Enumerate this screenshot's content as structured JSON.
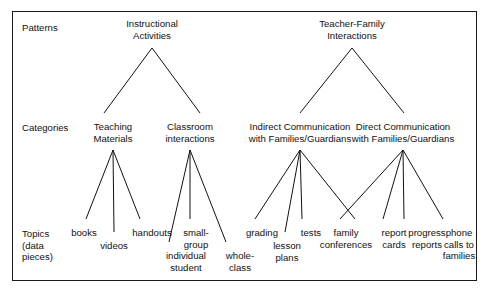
{
  "diagram": {
    "frame_color": "#1a1a1a",
    "text_color": "#111111",
    "background": "#ffffff",
    "row_labels": [
      {
        "id": "patterns",
        "label": "Patterns",
        "x": 22,
        "y": 22
      },
      {
        "id": "categories",
        "label": "Categories",
        "x": 22,
        "y": 122
      },
      {
        "id": "topics",
        "label": "Topics\n(data\npieces)",
        "x": 22,
        "y": 228
      }
    ],
    "patterns": [
      {
        "id": "instructional-activities",
        "label": "Instructional\nActivities",
        "x": 152,
        "y": 18
      },
      {
        "id": "teacher-family-interactions",
        "label": "Teacher-Family\nInteractions",
        "x": 352,
        "y": 18
      }
    ],
    "categories": [
      {
        "id": "teaching-materials",
        "label": "Teaching\nMaterials",
        "x": 113,
        "y": 121,
        "parent": "instructional-activities"
      },
      {
        "id": "classroom-interactions",
        "label": "Classroom\ninteractions",
        "x": 190,
        "y": 121,
        "parent": "instructional-activities"
      },
      {
        "id": "indirect-communication",
        "label": "Indirect Communication\nwith Families/Guardians",
        "x": 300,
        "y": 121,
        "parent": "teacher-family-interactions"
      },
      {
        "id": "direct-communication",
        "label": "Direct Communication\nwith Families/Guardians",
        "x": 403,
        "y": 121,
        "parent": "teacher-family-interactions"
      }
    ],
    "topics": [
      {
        "id": "books",
        "label": "books",
        "x": 84,
        "y": 227,
        "parent": "teaching-materials"
      },
      {
        "id": "videos",
        "label": "videos",
        "x": 114,
        "y": 240,
        "parent": "teaching-materials"
      },
      {
        "id": "handouts",
        "label": "handouts",
        "x": 152,
        "y": 227,
        "parent": "teaching-materials"
      },
      {
        "id": "individual-student",
        "label": "individual\nstudent",
        "x": 186,
        "y": 250,
        "parent": "classroom-interactions"
      },
      {
        "id": "small-group",
        "label": "small-\ngroup",
        "x": 196,
        "y": 227,
        "parent": "classroom-interactions"
      },
      {
        "id": "whole-class",
        "label": "whole-\nclass",
        "x": 240,
        "y": 250,
        "parent": "classroom-interactions"
      },
      {
        "id": "grading",
        "label": "grading",
        "x": 262,
        "y": 227,
        "parent": "indirect-communication"
      },
      {
        "id": "lesson-plans",
        "label": "lesson\nplans",
        "x": 287,
        "y": 240,
        "parent": "indirect-communication"
      },
      {
        "id": "tests",
        "label": "tests",
        "x": 311,
        "y": 227,
        "parent": "indirect-communication"
      },
      {
        "id": "family-conferences",
        "label": "family\nconferences",
        "x": 346,
        "y": 227,
        "parent": "indirect-communication"
      },
      {
        "id": "report-cards",
        "label": "report\ncards",
        "x": 394,
        "y": 227,
        "parent": "direct-communication"
      },
      {
        "id": "progress-reports",
        "label": "progress\nreports",
        "x": 427,
        "y": 227,
        "parent": "direct-communication"
      },
      {
        "id": "phone-calls-to-families",
        "label": "phone\ncalls to\nfamilies",
        "x": 459,
        "y": 227,
        "parent": "direct-communication"
      }
    ],
    "connectors": [
      {
        "from": "instructional-activities",
        "to": "teaching-materials",
        "x1": 152,
        "y1": 48,
        "x2": 104,
        "y2": 113
      },
      {
        "from": "instructional-activities",
        "to": "classroom-interactions",
        "x1": 152,
        "y1": 48,
        "x2": 200,
        "y2": 113
      },
      {
        "from": "teacher-family-interactions",
        "to": "indirect-communication",
        "x1": 352,
        "y1": 48,
        "x2": 300,
        "y2": 113
      },
      {
        "from": "teacher-family-interactions",
        "to": "direct-communication",
        "x1": 352,
        "y1": 48,
        "x2": 404,
        "y2": 113
      },
      {
        "from": "teaching-materials",
        "to": "books",
        "x1": 113,
        "y1": 150,
        "x2": 86,
        "y2": 219
      },
      {
        "from": "teaching-materials",
        "to": "videos",
        "x1": 113,
        "y1": 150,
        "x2": 114,
        "y2": 232
      },
      {
        "from": "teaching-materials",
        "to": "handouts",
        "x1": 113,
        "y1": 150,
        "x2": 140,
        "y2": 219
      },
      {
        "from": "classroom-interactions",
        "to": "individual-student",
        "x1": 190,
        "y1": 150,
        "x2": 169,
        "y2": 242
      },
      {
        "from": "classroom-interactions",
        "to": "small-group",
        "x1": 190,
        "y1": 150,
        "x2": 190,
        "y2": 219
      },
      {
        "from": "classroom-interactions",
        "to": "whole-class",
        "x1": 190,
        "y1": 150,
        "x2": 226,
        "y2": 242
      },
      {
        "from": "indirect-communication",
        "to": "grading",
        "x1": 300,
        "y1": 150,
        "x2": 255,
        "y2": 219
      },
      {
        "from": "indirect-communication",
        "to": "lesson-plans",
        "x1": 300,
        "y1": 150,
        "x2": 285,
        "y2": 232
      },
      {
        "from": "indirect-communication",
        "to": "tests",
        "x1": 300,
        "y1": 150,
        "x2": 302,
        "y2": 219
      },
      {
        "from": "indirect-communication",
        "to": "family-conferences",
        "x1": 300,
        "y1": 150,
        "x2": 355,
        "y2": 219
      },
      {
        "from": "direct-communication",
        "to": "report-cards",
        "x1": 403,
        "y1": 150,
        "x2": 340,
        "y2": 219
      },
      {
        "from": "direct-communication",
        "to": "progress-reports",
        "x1": 403,
        "y1": 150,
        "x2": 383,
        "y2": 219
      },
      {
        "from": "direct-communication",
        "to": "progress-reports-2",
        "x1": 403,
        "y1": 150,
        "x2": 404,
        "y2": 219
      },
      {
        "from": "direct-communication",
        "to": "phone-calls",
        "x1": 403,
        "y1": 150,
        "x2": 443,
        "y2": 219
      }
    ]
  }
}
